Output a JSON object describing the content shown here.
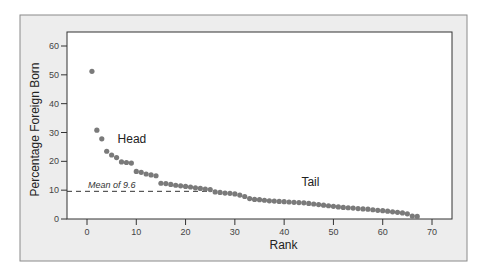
{
  "chart_data": {
    "type": "scatter",
    "title": "",
    "xlabel": "Rank",
    "ylabel": "Percentage Foreign Born",
    "xlim": [
      -4,
      74
    ],
    "ylim": [
      0,
      64
    ],
    "xticks": [
      0,
      10,
      20,
      30,
      40,
      50,
      60,
      70
    ],
    "yticks": [
      0,
      10,
      20,
      30,
      40,
      50,
      60
    ],
    "grid": false,
    "point_color": "#7a7a7a",
    "series": [
      {
        "name": "Percentage Foreign Born",
        "x": [
          1,
          2,
          3,
          4,
          5,
          6,
          7,
          8,
          9,
          10,
          11,
          12,
          13,
          14,
          15,
          16,
          17,
          18,
          19,
          20,
          21,
          22,
          23,
          24,
          25,
          26,
          27,
          28,
          29,
          30,
          31,
          32,
          33,
          34,
          35,
          36,
          37,
          38,
          39,
          40,
          41,
          42,
          43,
          44,
          45,
          46,
          47,
          48,
          49,
          50,
          51,
          52,
          53,
          54,
          55,
          56,
          57,
          58,
          59,
          60,
          61,
          62,
          63,
          64,
          65,
          66,
          67
        ],
        "y": [
          51.2,
          30.8,
          27.8,
          23.5,
          22.2,
          21.3,
          19.8,
          19.6,
          19.4,
          16.5,
          16.2,
          15.6,
          15.3,
          15.0,
          12.4,
          12.3,
          12.0,
          11.7,
          11.5,
          11.3,
          11.1,
          10.8,
          10.6,
          10.4,
          10.2,
          9.4,
          9.2,
          9.0,
          8.9,
          8.7,
          8.3,
          7.8,
          7.1,
          6.8,
          6.7,
          6.5,
          6.3,
          6.2,
          6.1,
          6.0,
          5.9,
          5.8,
          5.7,
          5.6,
          5.4,
          5.2,
          5.0,
          4.8,
          4.6,
          4.4,
          4.2,
          4.0,
          3.9,
          3.8,
          3.6,
          3.5,
          3.4,
          3.2,
          3.0,
          2.9,
          2.7,
          2.5,
          2.3,
          2.1,
          1.8,
          1.0,
          0.9
        ]
      }
    ],
    "reference_line": {
      "y": 9.6,
      "label": "Mean of 9.6",
      "style": "dashed"
    },
    "annotations": [
      {
        "text": "Head",
        "x": 6.2,
        "y": 26.5
      },
      {
        "text": "Tail",
        "x": 43.5,
        "y": 11.5
      }
    ]
  }
}
